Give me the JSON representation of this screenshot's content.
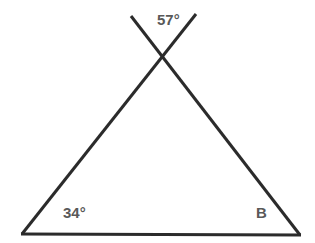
{
  "diagram": {
    "type": "triangle-with-crossing-lines",
    "line_color": "#2b2b2b",
    "label_color": "#595959",
    "labels": {
      "top_angle": "57°",
      "bottom_left_angle": "34°",
      "bottom_right_angle": "B"
    },
    "points": {
      "line1_start": [
        131,
        16
      ],
      "line1_end": [
        300,
        235
      ],
      "line2_start": [
        196,
        14
      ],
      "line2_end": [
        22,
        234
      ],
      "base_start": [
        22,
        234
      ],
      "base_end": [
        300,
        235
      ]
    }
  }
}
